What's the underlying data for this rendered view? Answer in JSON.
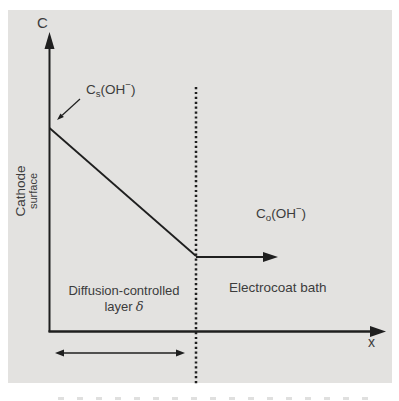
{
  "figure": {
    "y_axis_label": "C",
    "x_axis_label": "x",
    "cathode_label": {
      "line1": "Cathode",
      "line2": "surface"
    },
    "surface_concentration": {
      "symbol": "C",
      "subscript": "s",
      "open": "(OH",
      "superscript": "−",
      "close": ")"
    },
    "bulk_concentration": {
      "symbol": "C",
      "subscript": "o",
      "open": "(OH",
      "superscript": "−",
      "close": ")"
    },
    "diffusion_layer": {
      "line1": "Diffusion-controlled",
      "line2_prefix": "layer",
      "delta": "δ"
    },
    "bath_label": "Electrocoat bath"
  },
  "colors": {
    "panel_background": "#e3e2e0",
    "line_color": "#1f1f1f",
    "text_color": "#3c3c3c"
  }
}
